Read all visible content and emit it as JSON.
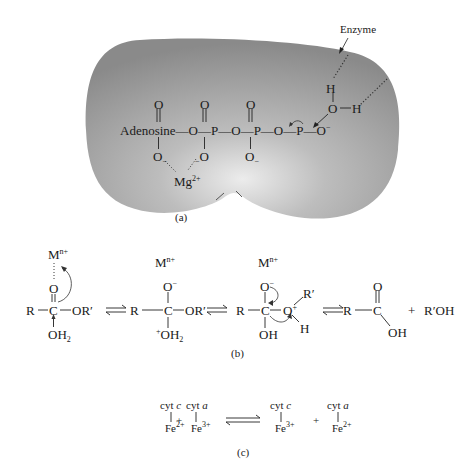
{
  "panel_a": {
    "caption": "(a)",
    "enzyme_label": "Enzyme",
    "adenosine": "Adenosine",
    "bond": "—",
    "O": "O",
    "P": "P",
    "H": "H",
    "O_minus": "O",
    "minus": "−",
    "Mg": "Mg",
    "Mg_charge": "2+",
    "colors": {
      "enzyme_dark": "#8c8c8c",
      "enzyme_light": "#e6e6e6"
    }
  },
  "panel_b": {
    "caption": "(b)",
    "M": "M",
    "M_charge": "n+",
    "R": "R",
    "C": "C",
    "O": "O",
    "OR_prime": "OR′",
    "OH2": "OH",
    "sub2": "2",
    "plus": "+",
    "minus": "−",
    "OH": "OH",
    "R_prime": "R′",
    "H": "H",
    "product_plus": "+",
    "R_prime_OH": "R′OH"
  },
  "panel_c": {
    "caption": "(c)",
    "cyt": "cyt",
    "c": "c",
    "a": "a",
    "Fe": "Fe",
    "charge_2": "2+",
    "charge_3": "3+",
    "plus": "+"
  }
}
